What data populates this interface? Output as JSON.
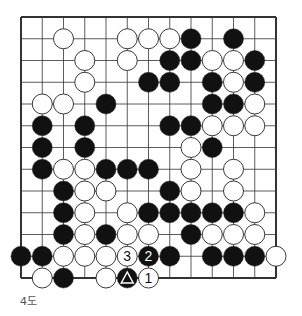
{
  "diagram": {
    "caption": "4도",
    "board_size": 13,
    "colors": {
      "black": "#111111",
      "white": "#ffffff",
      "line": "#333333",
      "label_on_black": "#ffffff",
      "label_on_white": "#111111"
    },
    "stones": [
      {
        "row": 1,
        "col": 2,
        "color": "white"
      },
      {
        "row": 1,
        "col": 5,
        "color": "white"
      },
      {
        "row": 1,
        "col": 6,
        "color": "white"
      },
      {
        "row": 1,
        "col": 7,
        "color": "white"
      },
      {
        "row": 1,
        "col": 8,
        "color": "black"
      },
      {
        "row": 1,
        "col": 10,
        "color": "black"
      },
      {
        "row": 2,
        "col": 3,
        "color": "white"
      },
      {
        "row": 2,
        "col": 5,
        "color": "white"
      },
      {
        "row": 2,
        "col": 7,
        "color": "black"
      },
      {
        "row": 2,
        "col": 8,
        "color": "black"
      },
      {
        "row": 2,
        "col": 9,
        "color": "white"
      },
      {
        "row": 2,
        "col": 10,
        "color": "white"
      },
      {
        "row": 2,
        "col": 11,
        "color": "black"
      },
      {
        "row": 3,
        "col": 3,
        "color": "white"
      },
      {
        "row": 3,
        "col": 6,
        "color": "black"
      },
      {
        "row": 3,
        "col": 7,
        "color": "black"
      },
      {
        "row": 3,
        "col": 9,
        "color": "black"
      },
      {
        "row": 3,
        "col": 10,
        "color": "white"
      },
      {
        "row": 3,
        "col": 11,
        "color": "black"
      },
      {
        "row": 4,
        "col": 1,
        "color": "white"
      },
      {
        "row": 4,
        "col": 2,
        "color": "white"
      },
      {
        "row": 4,
        "col": 4,
        "color": "black"
      },
      {
        "row": 4,
        "col": 9,
        "color": "black"
      },
      {
        "row": 4,
        "col": 10,
        "color": "black"
      },
      {
        "row": 4,
        "col": 11,
        "color": "white"
      },
      {
        "row": 5,
        "col": 1,
        "color": "black"
      },
      {
        "row": 5,
        "col": 3,
        "color": "black"
      },
      {
        "row": 5,
        "col": 7,
        "color": "black"
      },
      {
        "row": 5,
        "col": 8,
        "color": "black"
      },
      {
        "row": 5,
        "col": 9,
        "color": "white"
      },
      {
        "row": 5,
        "col": 10,
        "color": "white"
      },
      {
        "row": 5,
        "col": 11,
        "color": "white"
      },
      {
        "row": 6,
        "col": 1,
        "color": "black"
      },
      {
        "row": 6,
        "col": 3,
        "color": "black"
      },
      {
        "row": 6,
        "col": 8,
        "color": "white"
      },
      {
        "row": 6,
        "col": 9,
        "color": "black"
      },
      {
        "row": 7,
        "col": 1,
        "color": "black"
      },
      {
        "row": 7,
        "col": 2,
        "color": "white"
      },
      {
        "row": 7,
        "col": 3,
        "color": "white"
      },
      {
        "row": 7,
        "col": 4,
        "color": "black"
      },
      {
        "row": 7,
        "col": 5,
        "color": "black"
      },
      {
        "row": 7,
        "col": 6,
        "color": "black"
      },
      {
        "row": 7,
        "col": 8,
        "color": "white"
      },
      {
        "row": 7,
        "col": 10,
        "color": "white"
      },
      {
        "row": 8,
        "col": 2,
        "color": "black"
      },
      {
        "row": 8,
        "col": 3,
        "color": "white"
      },
      {
        "row": 8,
        "col": 4,
        "color": "white"
      },
      {
        "row": 8,
        "col": 7,
        "color": "black"
      },
      {
        "row": 8,
        "col": 8,
        "color": "white"
      },
      {
        "row": 8,
        "col": 10,
        "color": "white"
      },
      {
        "row": 9,
        "col": 2,
        "color": "black"
      },
      {
        "row": 9,
        "col": 3,
        "color": "white"
      },
      {
        "row": 9,
        "col": 5,
        "color": "white"
      },
      {
        "row": 9,
        "col": 6,
        "color": "black"
      },
      {
        "row": 9,
        "col": 7,
        "color": "black"
      },
      {
        "row": 9,
        "col": 8,
        "color": "black"
      },
      {
        "row": 9,
        "col": 9,
        "color": "black"
      },
      {
        "row": 9,
        "col": 10,
        "color": "black"
      },
      {
        "row": 9,
        "col": 11,
        "color": "white"
      },
      {
        "row": 10,
        "col": 2,
        "color": "black"
      },
      {
        "row": 10,
        "col": 3,
        "color": "white"
      },
      {
        "row": 10,
        "col": 4,
        "color": "black"
      },
      {
        "row": 10,
        "col": 5,
        "color": "white"
      },
      {
        "row": 10,
        "col": 6,
        "color": "white"
      },
      {
        "row": 10,
        "col": 8,
        "color": "black"
      },
      {
        "row": 10,
        "col": 9,
        "color": "white"
      },
      {
        "row": 10,
        "col": 10,
        "color": "white"
      },
      {
        "row": 10,
        "col": 11,
        "color": "white"
      },
      {
        "row": 11,
        "col": 0,
        "color": "black"
      },
      {
        "row": 11,
        "col": 1,
        "color": "black"
      },
      {
        "row": 11,
        "col": 2,
        "color": "white"
      },
      {
        "row": 11,
        "col": 3,
        "color": "white"
      },
      {
        "row": 11,
        "col": 4,
        "color": "white"
      },
      {
        "row": 11,
        "col": 5,
        "color": "white",
        "label": "3"
      },
      {
        "row": 11,
        "col": 6,
        "color": "black",
        "label": "2"
      },
      {
        "row": 11,
        "col": 7,
        "color": "black"
      },
      {
        "row": 11,
        "col": 9,
        "color": "black"
      },
      {
        "row": 11,
        "col": 10,
        "color": "black"
      },
      {
        "row": 11,
        "col": 11,
        "color": "black"
      },
      {
        "row": 11,
        "col": 12,
        "color": "white"
      },
      {
        "row": 12,
        "col": 1,
        "color": "white"
      },
      {
        "row": 12,
        "col": 2,
        "color": "black"
      },
      {
        "row": 12,
        "col": 4,
        "color": "white"
      },
      {
        "row": 12,
        "col": 5,
        "color": "black",
        "marker": "triangle"
      },
      {
        "row": 12,
        "col": 6,
        "color": "white",
        "label": "1"
      }
    ]
  }
}
